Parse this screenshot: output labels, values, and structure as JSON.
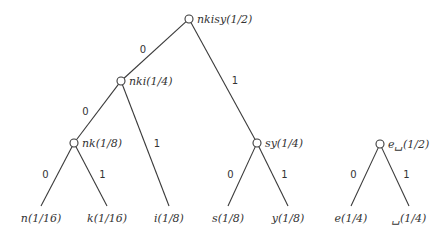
{
  "diagram": {
    "type": "huffman-tree",
    "nodes": [
      {
        "id": "root",
        "label": "nkisy(1/2)",
        "x": 189,
        "y": 19
      },
      {
        "id": "nki",
        "label": "nki(1/4)",
        "x": 121,
        "y": 81
      },
      {
        "id": "nk",
        "label": "nk(1/8)",
        "x": 74,
        "y": 143
      },
      {
        "id": "sy",
        "label": "sy(1/4)",
        "x": 257,
        "y": 143
      },
      {
        "id": "e_",
        "label": "e␣(1/2)",
        "x": 380,
        "y": 144
      }
    ],
    "leaves": [
      {
        "id": "n",
        "label": "n(1/16)",
        "x": 41,
        "y": 206
      },
      {
        "id": "k",
        "label": "k(1/16)",
        "x": 107,
        "y": 206
      },
      {
        "id": "i",
        "label": "i(1/8)",
        "x": 169,
        "y": 206
      },
      {
        "id": "s",
        "label": "s(1/8)",
        "x": 228,
        "y": 206
      },
      {
        "id": "y",
        "label": "y(1/8)",
        "x": 288,
        "y": 206
      },
      {
        "id": "e",
        "label": "e(1/4)",
        "x": 351,
        "y": 206
      },
      {
        "id": "_",
        "label": "␣(1/4)",
        "x": 409,
        "y": 206
      }
    ],
    "edges": [
      {
        "from": "root",
        "to": "nki",
        "bit": "0"
      },
      {
        "from": "root",
        "to": "sy",
        "bit": "1"
      },
      {
        "from": "nki",
        "to": "nk",
        "bit": "0"
      },
      {
        "from": "nki",
        "to": "i",
        "bit": "1"
      },
      {
        "from": "nk",
        "to": "n",
        "bit": "0"
      },
      {
        "from": "nk",
        "to": "k",
        "bit": "1"
      },
      {
        "from": "sy",
        "to": "s",
        "bit": "0"
      },
      {
        "from": "sy",
        "to": "y",
        "bit": "1"
      },
      {
        "from": "e_",
        "to": "e",
        "bit": "0"
      },
      {
        "from": "e_",
        "to": "_",
        "bit": "1"
      }
    ]
  }
}
